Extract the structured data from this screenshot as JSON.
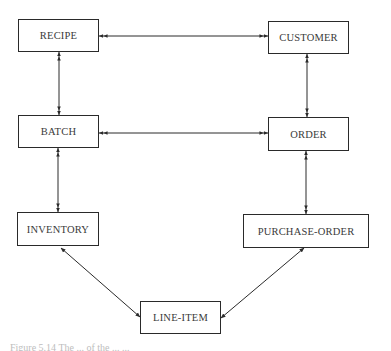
{
  "diagram": {
    "type": "entity-relationship",
    "nodes": [
      {
        "id": "recipe",
        "label": "RECIPE",
        "x": 18,
        "y": 19,
        "w": 81,
        "h": 33
      },
      {
        "id": "customer",
        "label": "CUSTOMER",
        "x": 268,
        "y": 21,
        "w": 81,
        "h": 33
      },
      {
        "id": "batch",
        "label": "BATCH",
        "x": 18,
        "y": 115,
        "w": 81,
        "h": 33
      },
      {
        "id": "order",
        "label": "ORDER",
        "x": 268,
        "y": 117,
        "w": 81,
        "h": 34
      },
      {
        "id": "inventory",
        "label": "INVENTORY",
        "x": 17,
        "y": 212,
        "w": 82,
        "h": 34
      },
      {
        "id": "purchase_order",
        "label": "PURCHASE-ORDER",
        "x": 243,
        "y": 214,
        "w": 126,
        "h": 34
      },
      {
        "id": "line_item",
        "label": "LINE-ITEM",
        "x": 140,
        "y": 301,
        "w": 81,
        "h": 33
      }
    ],
    "edges": [
      {
        "from": "recipe",
        "to": "customer",
        "arrows": "double-headed both ends",
        "x1": 99,
        "y1": 36,
        "x2": 268,
        "y2": 36
      },
      {
        "from": "recipe",
        "to": "batch",
        "arrows": "double-headed both ends",
        "x1": 59,
        "y1": 52,
        "x2": 59,
        "y2": 115
      },
      {
        "from": "batch",
        "to": "order",
        "arrows": "double-headed both ends",
        "x1": 99,
        "y1": 133,
        "x2": 268,
        "y2": 133
      },
      {
        "from": "customer",
        "to": "order",
        "arrows": "double-headed both ends",
        "x1": 307,
        "y1": 54,
        "x2": 307,
        "y2": 117
      },
      {
        "from": "batch",
        "to": "inventory",
        "arrows": "double-headed both ends",
        "x1": 58,
        "y1": 148,
        "x2": 58,
        "y2": 212
      },
      {
        "from": "order",
        "to": "purchase_order",
        "arrows": "double-headed both ends",
        "x1": 306,
        "y1": 151,
        "x2": 306,
        "y2": 214
      },
      {
        "from": "inventory",
        "to": "line_item",
        "arrows": "single-headed both ends",
        "x1": 61,
        "y1": 248,
        "x2": 140,
        "y2": 317
      },
      {
        "from": "purchase_order",
        "to": "line_item",
        "arrows": "single-headed both ends",
        "x1": 304,
        "y1": 248,
        "x2": 221,
        "y2": 318
      }
    ]
  },
  "caption": {
    "text": "Figure 5.14   The ...   of the ...   ..."
  },
  "colors": {
    "line": "#2a2a2a",
    "text": "#3a3a3a",
    "background": "#ffffff"
  }
}
